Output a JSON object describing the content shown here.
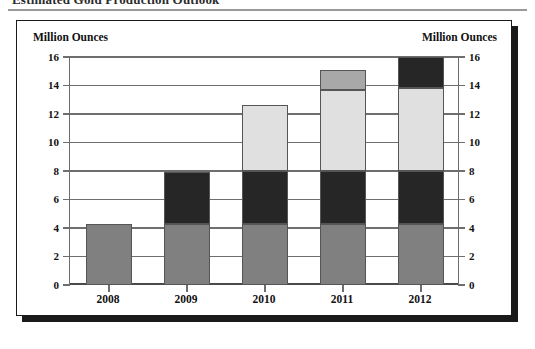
{
  "title": "Estimated Gold Production Outlook",
  "chart_box": {
    "axis_caption_left": "Million Ounces",
    "axis_caption_right": "Million Ounces"
  },
  "chart_data": {
    "type": "bar",
    "subtype": "stacked-column",
    "title": "Estimated Gold Production Outlook",
    "xlabel": "",
    "ylabel": "Million Ounces",
    "ylabel_right": "Million Ounces",
    "ylim": [
      0,
      16
    ],
    "yticks": [
      0,
      2,
      4,
      6,
      8,
      10,
      12,
      14,
      16
    ],
    "ytick_labels": [
      "0",
      "2",
      "4",
      "6",
      "8",
      "10",
      "12",
      "14",
      "16"
    ],
    "grid": true,
    "dual_axis": true,
    "legend": false,
    "categories": [
      "2008",
      "2009",
      "2010",
      "2011",
      "2012"
    ],
    "series": [
      {
        "name": "Segment 1",
        "color": "#808080",
        "values": [
          4.3,
          4.3,
          4.3,
          4.3,
          4.3
        ]
      },
      {
        "name": "Segment 2",
        "color": "#262626",
        "values": [
          0,
          3.6,
          3.7,
          3.7,
          3.7
        ]
      },
      {
        "name": "Segment 3",
        "color": "#e0e0e0",
        "values": [
          0,
          0,
          4.6,
          5.7,
          5.8
        ]
      },
      {
        "name": "Segment 4",
        "color": "#a8a8a8",
        "values": [
          0,
          0,
          0,
          1.4,
          0
        ]
      },
      {
        "name": "Segment 5",
        "color": "#262626",
        "values": [
          0,
          0,
          0,
          0,
          2.2
        ]
      }
    ],
    "totals": [
      4.3,
      7.9,
      12.6,
      15.1,
      16.0
    ]
  },
  "colors": {
    "segment_gray": "#808080",
    "segment_black": "#262626",
    "segment_light": "#e0e0e0",
    "segment_medium": "#a8a8a8",
    "frame": "#1a1a1a",
    "grid": "#6e6e6e"
  }
}
